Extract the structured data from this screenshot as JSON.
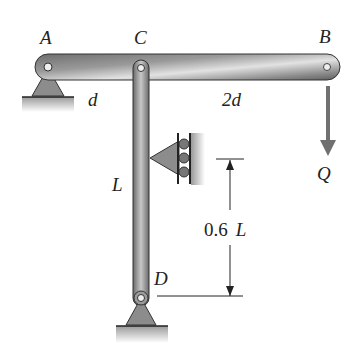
{
  "labels": {
    "A": "A",
    "B": "B",
    "C": "C",
    "D": "D",
    "d": "d",
    "two_d": "2d",
    "L": "L",
    "Q": "Q",
    "dim_value": "0.6",
    "dim_unit": "L"
  },
  "colors": {
    "member_dark": "#6f6f6f",
    "member_light": "#d9d9d9",
    "support_fill": "#8c8c8c",
    "ground": "#a0a0a0",
    "arrow": "#707070",
    "line": "#222222"
  }
}
